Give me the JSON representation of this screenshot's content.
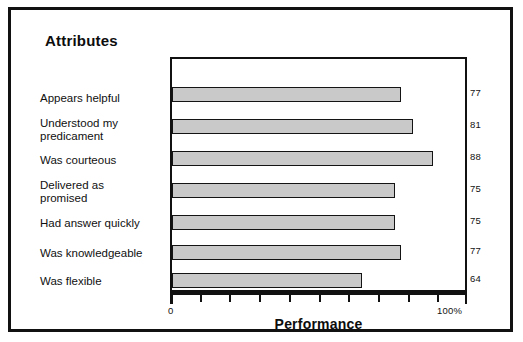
{
  "chart_data": {
    "type": "bar",
    "orientation": "horizontal",
    "title": "Attributes",
    "xlabel": "Performance",
    "ylabel": "",
    "xlim": [
      0,
      100
    ],
    "x_tick_min_label": "0",
    "x_tick_max_label": "100%",
    "x_tick_count": 11,
    "grid": false,
    "legend": null,
    "bar_fill_color": "#c9c9c9",
    "bar_border_color": "#141414",
    "categories": [
      "Appears helpful",
      "Understood my predicament",
      "Was courteous",
      "Delivered as promised",
      "Had answer quickly",
      "Was knowledgeable",
      "Was flexible"
    ],
    "values": [
      77,
      81,
      88,
      75,
      75,
      77,
      64
    ],
    "data_labels": [
      "77",
      "81",
      "88",
      "75",
      "75",
      "77",
      "64"
    ],
    "category_lines": [
      [
        "Appears helpful"
      ],
      [
        "Understood my",
        "predicament"
      ],
      [
        "Was courteous"
      ],
      [
        "Delivered as",
        "promised"
      ],
      [
        "Had answer quickly"
      ],
      [
        "Was knowledgeable"
      ],
      [
        "Was flexible"
      ]
    ]
  }
}
